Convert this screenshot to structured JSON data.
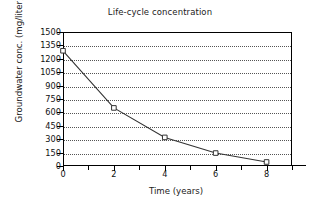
{
  "chart_data": {
    "type": "line",
    "title": "Life-cycle concentration",
    "xlabel": "Time (years)",
    "ylabel": "Groundwater conc. (mg/liter)",
    "x": [
      0,
      2,
      4,
      6,
      8
    ],
    "values": [
      1290,
      650,
      320,
      145,
      45
    ],
    "series": [
      {
        "name": "Groundwater concentration",
        "values": [
          1290,
          650,
          320,
          145,
          45
        ],
        "marker": "square",
        "line_color": "#333333",
        "marker_color": "#333333"
      }
    ],
    "xlim": [
      0,
      9
    ],
    "ylim": [
      0,
      1500
    ],
    "xticks": [
      0,
      2,
      4,
      6,
      8
    ],
    "xtick_labels": [
      "0",
      "2",
      "4",
      "6",
      "8"
    ],
    "xminor_ticks": [
      1,
      3,
      5,
      7,
      9
    ],
    "yticks": [
      0,
      150,
      300,
      450,
      600,
      750,
      900,
      1050,
      1200,
      1350,
      1500
    ],
    "ytick_labels": [
      "0",
      "150",
      "300",
      "450",
      "600",
      "750",
      "900",
      "1050",
      "1200",
      "1350",
      "1500"
    ],
    "grid": "horizontal-dotted",
    "legend": "none"
  },
  "axis": {
    "y_title": "Groundwater conc. (mg/liter)",
    "x_title": "Time (years)"
  },
  "title": "Life-cycle concentration"
}
